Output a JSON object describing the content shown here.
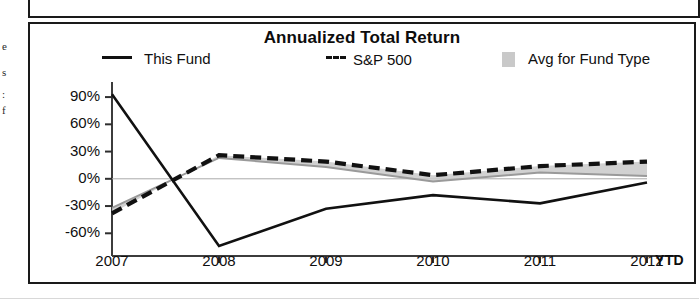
{
  "page": {
    "gutter_fragments": [
      "e",
      "s",
      ":",
      "f"
    ]
  },
  "chart_data": {
    "type": "line",
    "title": "Annualized Total Return",
    "xlabel": "",
    "ylabel": "",
    "categories": [
      "2007",
      "2008",
      "2009",
      "2010",
      "2011",
      "2012 YTD"
    ],
    "x_tick_labels": [
      "2007",
      "2008",
      "2009",
      "2010",
      "2011",
      "2012"
    ],
    "x_suffix_label": "YTD",
    "y_tick_labels": [
      "90%",
      "60%",
      "30%",
      "0%",
      "-30%",
      "-60%"
    ],
    "y_tick_values": [
      90,
      60,
      30,
      0,
      -30,
      -60
    ],
    "ylim": [
      -85,
      100
    ],
    "grid": false,
    "legend_position": "top",
    "series": [
      {
        "name": "This Fund",
        "style": "solid",
        "color": "#111111",
        "values": [
          93,
          -74,
          -33,
          -18,
          -27,
          -4
        ]
      },
      {
        "name": "S&P 500",
        "style": "dashed",
        "color": "#111111",
        "values": [
          -38,
          26,
          19,
          4,
          14,
          19
        ]
      },
      {
        "name": "Avg for Fund Type",
        "style": "filled-area",
        "color": "#c9c9c9",
        "values": [
          -32,
          23,
          13,
          -3,
          7,
          3
        ]
      }
    ],
    "annotations": []
  }
}
